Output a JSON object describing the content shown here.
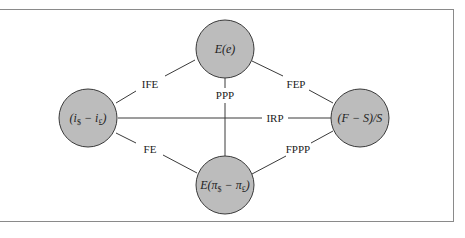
{
  "diagram": {
    "type": "parity-conditions-network",
    "nodes": [
      {
        "id": "expected_change",
        "label": "E(e)"
      },
      {
        "id": "interest_diff",
        "label_main_open": "(i",
        "sub1": "$",
        "label_mid": " − i",
        "sub2": "£",
        "label_close": ")"
      },
      {
        "id": "forward_premium",
        "label": "(F − S)/S"
      },
      {
        "id": "inflation_diff",
        "label_main_open": "E(π",
        "sub1": "$",
        "label_mid": " − π",
        "sub2": "£",
        "label_close": ")"
      }
    ],
    "edges": [
      {
        "label": "IFE",
        "from": "interest_diff",
        "to": "expected_change"
      },
      {
        "label": "FEP",
        "from": "expected_change",
        "to": "forward_premium"
      },
      {
        "label": "PPP",
        "from": "expected_change",
        "to": "inflation_diff"
      },
      {
        "label": "IRP",
        "from": "interest_diff",
        "to": "forward_premium"
      },
      {
        "label": "FE",
        "from": "interest_diff",
        "to": "inflation_diff"
      },
      {
        "label": "FPPP",
        "from": "inflation_diff",
        "to": "forward_premium"
      }
    ],
    "colors": {
      "node_fill": "#bcbcbc",
      "line": "#3a3a3a",
      "frame": "#8a8a8a"
    }
  }
}
